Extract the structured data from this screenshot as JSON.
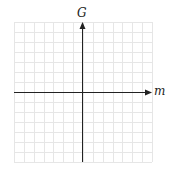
{
  "diagram": {
    "type": "coordinate-plane",
    "x_axis_label": "m",
    "y_axis_label": "G",
    "grid": {
      "columns": 14,
      "rows": 14,
      "visible": true
    },
    "colors": {
      "grid": "#e6e6e6",
      "axis": "#222222",
      "background": "#ffffff"
    }
  }
}
